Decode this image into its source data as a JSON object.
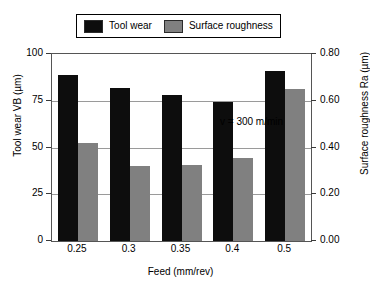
{
  "chart_data": {
    "type": "bar",
    "title": "",
    "subtitle": "",
    "categories": [
      "0.25",
      "0.3",
      "0.35",
      "0.4",
      "0.5"
    ],
    "series": [
      {
        "name": "Tool wear",
        "axis": "left",
        "color": "#0d0d0d",
        "values": [
          89,
          82,
          78,
          74.5,
          91
        ]
      },
      {
        "name": "Surface roughness",
        "axis": "right",
        "color": "#808080",
        "values": [
          0.42,
          0.32,
          0.325,
          0.355,
          0.65
        ]
      }
    ],
    "xlabel": "Feed (mm/rev)",
    "ylabel": "Tool wear VB (µm)",
    "y2label": "Surface roughness Ra (µm)",
    "ylim": [
      0,
      100
    ],
    "y2lim": [
      0.0,
      0.8
    ],
    "yticks": [
      "0",
      "25",
      "50",
      "75",
      "100"
    ],
    "ytick_values": [
      0,
      25,
      50,
      75,
      100
    ],
    "y2ticks": [
      "0.00",
      "0.20",
      "0.40",
      "0.60",
      "0.80"
    ],
    "y2tick_values": [
      0.0,
      0.2,
      0.4,
      0.6,
      0.8
    ],
    "grid": true,
    "grid_axis": "y",
    "legend_position": "top-center",
    "annotations": [
      {
        "text": "v = 300 m/min",
        "x": "0.35",
        "y": 92
      }
    ]
  },
  "legend": {
    "entries": [
      {
        "label": "Tool wear",
        "color": "#0d0d0d"
      },
      {
        "label": "Surface roughness",
        "color": "#808080"
      }
    ]
  },
  "axes": {
    "left": {
      "title": "Tool wear VB (µm)",
      "ticks": [
        "0",
        "25",
        "50",
        "75",
        "100"
      ]
    },
    "right": {
      "title": "Surface roughness Ra (µm)",
      "ticks": [
        "0.00",
        "0.20",
        "0.40",
        "0.60",
        "0.80"
      ]
    },
    "bottom": {
      "title": "Feed (mm/rev)",
      "ticks": [
        "0.25",
        "0.3",
        "0.35",
        "0.4",
        "0.5"
      ]
    }
  },
  "annotation": {
    "text": "v = 300 m/min"
  }
}
